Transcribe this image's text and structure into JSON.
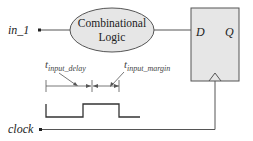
{
  "diagram": {
    "input_label": "in_1",
    "clock_label": "clock",
    "logic_block": {
      "line1": "Combinational",
      "line2": "Logic"
    },
    "flipflop": {
      "d_label": "D",
      "q_label": "Q"
    },
    "timing": {
      "input_delay": {
        "base": "t",
        "sub": "input_delay"
      },
      "input_margin": {
        "base": "t",
        "sub": "input_margin"
      }
    },
    "colors": {
      "line": "#555555",
      "fill": "#e6e6e6",
      "text": "#222222"
    }
  }
}
